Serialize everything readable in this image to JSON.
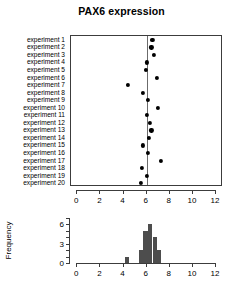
{
  "chart_data": [
    {
      "type": "scatter",
      "id": "dotplot",
      "title": "PAX6 expression",
      "xlabel": "",
      "ylabel": "",
      "xlim": [
        -0.55,
        12.6
      ],
      "ylim_categories": 20,
      "grid": false,
      "legend": null,
      "reference_line": {
        "orientation": "vertical",
        "value": 6.05,
        "color": "#6b6b6b"
      },
      "xticks": [
        0,
        2,
        4,
        6,
        8,
        10,
        12
      ],
      "xticklabels": [
        "0",
        "2",
        "4",
        "6",
        "8",
        "10",
        "12"
      ],
      "categories": [
        "experiment 1",
        "experiment 2",
        "experiment 3",
        "experiment 4",
        "experiment 5",
        "experiment 6",
        "experiment 7",
        "experiment 8",
        "experiment 9",
        "experiment 10",
        "experiment 11",
        "experiment 12",
        "experiment 13",
        "experiment 14",
        "experiment 15",
        "experiment 16",
        "experiment 17",
        "experiment 18",
        "experiment 19",
        "experiment 20"
      ],
      "values": [
        6.5,
        6.4,
        6.6,
        6.0,
        5.9,
        6.9,
        4.4,
        5.7,
        6.1,
        7.0,
        6.0,
        6.3,
        6.4,
        6.2,
        5.7,
        6.1,
        7.2,
        5.6,
        6.0,
        5.5
      ]
    },
    {
      "type": "bar",
      "id": "histogram",
      "title": "",
      "xlabel": "",
      "ylabel": "Frequency",
      "xlim": [
        -0.55,
        12.6
      ],
      "ylim": [
        0,
        7
      ],
      "grid": false,
      "legend": null,
      "bin_width": 0.4,
      "xticks": [
        0,
        2,
        4,
        6,
        8,
        10,
        12
      ],
      "xticklabels": [
        "0",
        "2",
        "4",
        "6",
        "8",
        "10",
        "12"
      ],
      "yticks": [
        0,
        1,
        2,
        3,
        4,
        5,
        6,
        7
      ],
      "yticklabels_shown": [
        "0",
        "3",
        "6"
      ],
      "bins": [
        {
          "start": 4.2,
          "end": 4.6,
          "count": 1
        },
        {
          "start": 5.4,
          "end": 5.8,
          "count": 2
        },
        {
          "start": 5.8,
          "end": 6.2,
          "count": 5
        },
        {
          "start": 6.2,
          "end": 6.6,
          "count": 6
        },
        {
          "start": 6.6,
          "end": 7.0,
          "count": 4
        },
        {
          "start": 7.0,
          "end": 7.4,
          "count": 2
        }
      ],
      "bar_color": "#4d4d4d"
    }
  ],
  "title": {
    "text": "PAX6 expression"
  },
  "dotplot": {
    "ylabels": [
      "experiment 1",
      "experiment 2",
      "experiment 3",
      "experiment 4",
      "experiment 5",
      "experiment 6",
      "experiment 7",
      "experiment 8",
      "experiment 9",
      "experiment 10",
      "experiment 11",
      "experiment 12",
      "experiment 13",
      "experiment 14",
      "experiment 15",
      "experiment 16",
      "experiment 17",
      "experiment 18",
      "experiment 19",
      "experiment 20"
    ],
    "xticklabels": [
      "0",
      "2",
      "4",
      "6",
      "8",
      "10",
      "12"
    ]
  },
  "histogram": {
    "ylabel": "Frequency",
    "yticklabels": [
      "0",
      "3",
      "6"
    ],
    "xticklabels": [
      "0",
      "2",
      "4",
      "6",
      "8",
      "10",
      "12"
    ]
  }
}
